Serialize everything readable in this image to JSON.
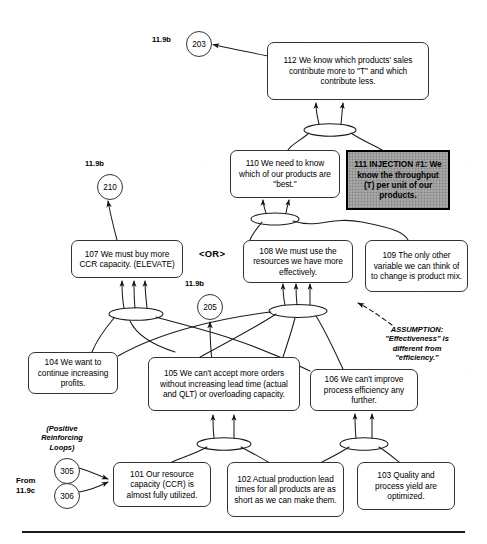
{
  "diagram": {
    "type": "logic-tree",
    "bottom_rule": true
  },
  "nodes": [
    {
      "id": "112",
      "name": "entity-112",
      "text": "112   We know which products' sales contribute more to \"T\" and which contribute less.",
      "style": "rounded",
      "x": 267,
      "y": 42,
      "w": 162,
      "h": 58
    },
    {
      "id": "110",
      "name": "entity-110",
      "text": "110   We need to know which of our products are \"best.\"",
      "style": "rounded",
      "x": 230,
      "y": 150,
      "w": 110,
      "h": 48
    },
    {
      "id": "111",
      "name": "entity-111-injection",
      "text": "111   INJECTION #1: We know the throughput (T) per unit of our products.",
      "style": "injection",
      "x": 346,
      "y": 150,
      "w": 104,
      "h": 60
    },
    {
      "id": "107",
      "name": "entity-107",
      "text": "107   We must buy more CCR capacity. (ELEVATE)",
      "style": "rounded",
      "x": 71,
      "y": 240,
      "w": 112,
      "h": 38
    },
    {
      "id": "108",
      "name": "entity-108",
      "text": "108   We must use the resources we have more effectively.",
      "style": "rounded",
      "x": 243,
      "y": 240,
      "w": 110,
      "h": 43
    },
    {
      "id": "109",
      "name": "entity-109",
      "text": "109   The only other variable we can think of to change is product mix.",
      "style": "rounded",
      "x": 365,
      "y": 240,
      "w": 103,
      "h": 52
    },
    {
      "id": "104",
      "name": "entity-104",
      "text": "104   We want to continue increasing profits.",
      "style": "rounded",
      "x": 28,
      "y": 352,
      "w": 90,
      "h": 42
    },
    {
      "id": "105",
      "name": "entity-105",
      "text": "105   We can't accept more orders without increasing lead time (actual and QLT) or overloading capacity.",
      "style": "rounded",
      "x": 148,
      "y": 357,
      "w": 152,
      "h": 54
    },
    {
      "id": "106",
      "name": "entity-106",
      "text": "106   We can't improve process efficiency any further.",
      "style": "rounded",
      "x": 310,
      "y": 369,
      "w": 108,
      "h": 42
    },
    {
      "id": "101",
      "name": "entity-101",
      "text": "101   Our resource capacity (CCR) is almost fully utilized.",
      "style": "rounded",
      "x": 113,
      "y": 462,
      "w": 98,
      "h": 45
    },
    {
      "id": "102",
      "name": "entity-102",
      "text": "102   Actual production lead times for all products are as short as we can make them.",
      "style": "rounded",
      "x": 227,
      "y": 462,
      "w": 117,
      "h": 55
    },
    {
      "id": "103",
      "name": "entity-103",
      "text": "103   Quality and process yield are optimized.",
      "style": "rounded",
      "x": 357,
      "y": 462,
      "w": 98,
      "h": 48
    }
  ],
  "connector_circles": [
    {
      "id": "203",
      "name": "connector-circle-203",
      "value": "203",
      "x": 186,
      "y": 31
    },
    {
      "id": "210",
      "name": "connector-circle-210",
      "value": "210",
      "x": 97,
      "y": 174
    },
    {
      "id": "205",
      "name": "connector-circle-205",
      "value": "205",
      "x": 197,
      "y": 294
    },
    {
      "id": "305",
      "name": "connector-circle-305",
      "value": "305",
      "x": 54,
      "y": 458
    },
    {
      "id": "306",
      "name": "connector-circle-306",
      "value": "306",
      "x": 54,
      "y": 483
    }
  ],
  "reference_labels": [
    {
      "name": "ref-label-203",
      "text": "11.9b",
      "x": 152,
      "y": 35
    },
    {
      "name": "ref-label-210",
      "text": "11.9b",
      "x": 85,
      "y": 159
    },
    {
      "name": "ref-label-205",
      "text": "11.9b",
      "x": 185,
      "y": 279
    }
  ],
  "or_operator": {
    "name": "or-operator",
    "text": "<OR>",
    "x": 199,
    "y": 248
  },
  "annotations": [
    {
      "name": "assumption-note",
      "text": "ASSUMPTION:\n\"Effectiveness\" is\ndifferent from\n\"efficiency.\"",
      "x": 362,
      "y": 325,
      "w": 110
    },
    {
      "name": "positive-reinforcing-loops-note",
      "text": "(Positive\nReinforcing\nLoops)",
      "x": 22,
      "y": 424,
      "w": 80
    },
    {
      "name": "from-reference-label",
      "text": "From\n11.9c",
      "x": 16,
      "y": 476,
      "w": 40
    }
  ]
}
